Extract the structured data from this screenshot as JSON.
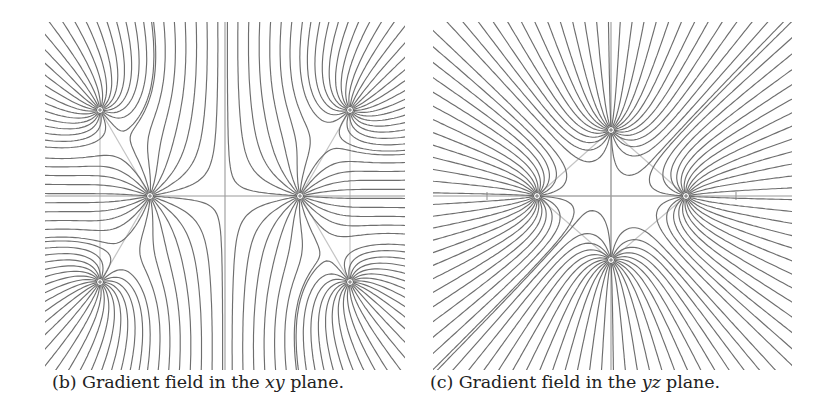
{
  "figure": {
    "panels": [
      {
        "id": "b",
        "caption_label": "(b)",
        "caption_text": "Gradient field in the",
        "caption_var": "xy",
        "caption_suffix": "plane.",
        "axis_horizontal": "x",
        "axis_vertical": "y",
        "box": {
          "x0": 45,
          "y0": 22,
          "x1": 405,
          "y1": 370
        },
        "origin": {
          "x": 225,
          "y": 196
        },
        "sources": [
          {
            "x": 100,
            "y": 110
          },
          {
            "x": 350,
            "y": 110
          },
          {
            "x": 150,
            "y": 196
          },
          {
            "x": 300,
            "y": 196
          },
          {
            "x": 100,
            "y": 282
          },
          {
            "x": 350,
            "y": 282
          }
        ],
        "lines_per_source": 24
      },
      {
        "id": "c",
        "caption_label": "(c)",
        "caption_text": "Gradient field in the",
        "caption_var": "yz",
        "caption_suffix": "plane.",
        "axis_horizontal": "y",
        "axis_vertical": "z",
        "box": {
          "x0": 433,
          "y0": 22,
          "x1": 792,
          "y1": 370
        },
        "origin": {
          "x": 611,
          "y": 196
        },
        "ticks_x": [
          487,
          736
        ],
        "sources": [
          {
            "x": 537,
            "y": 196
          },
          {
            "x": 686,
            "y": 196
          },
          {
            "x": 611,
            "y": 130
          },
          {
            "x": 611,
            "y": 260
          }
        ],
        "lines_per_source": 26
      }
    ],
    "colors": {
      "field_line": "#6e6e6e",
      "axis": "#9a9a9a",
      "guide": "#c4c4c4",
      "source_marker": "#555555"
    }
  }
}
